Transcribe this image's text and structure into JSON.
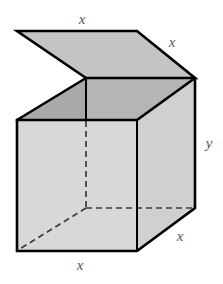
{
  "figure": {
    "name": "open-box-with-lid-diagram",
    "background_color": "#ffffff",
    "colors": {
      "outline": "#000000",
      "front_face": "#d8d8d8",
      "right_face": "#d0d0d0",
      "lid_top": "#c3c3c3",
      "interior_rim_left": "#a8a8a8",
      "interior_rim_back": "#b4b4b4",
      "hidden_edge": "#3c3c3c",
      "label_text": "#58585a"
    },
    "labels": [
      {
        "id": "top-width",
        "text": "x",
        "x": 82,
        "y": 19
      },
      {
        "id": "lid-depth",
        "text": "x",
        "x": 172,
        "y": 42
      },
      {
        "id": "box-height",
        "text": "y",
        "x": 209,
        "y": 143
      },
      {
        "id": "base-depth",
        "text": "x",
        "x": 180,
        "y": 236
      },
      {
        "id": "base-width",
        "text": "x",
        "x": 80,
        "y": 265
      }
    ],
    "geometry": {
      "lid": {
        "tip": [
          17,
          31
        ],
        "top_right": [
          137,
          31
        ],
        "right": [
          195,
          78
        ],
        "notch": [
          86,
          78
        ]
      },
      "box": {
        "front_top_left": [
          17,
          120
        ],
        "front_top_right": [
          137,
          120
        ],
        "front_bottom_left": [
          17,
          251
        ],
        "front_bottom_right": [
          137,
          251
        ],
        "right_top": [
          195,
          78
        ],
        "right_bottom": [
          195,
          208
        ],
        "back_top_left": [
          86,
          78
        ],
        "hidden_bottom_corner": [
          86,
          208
        ]
      }
    }
  }
}
